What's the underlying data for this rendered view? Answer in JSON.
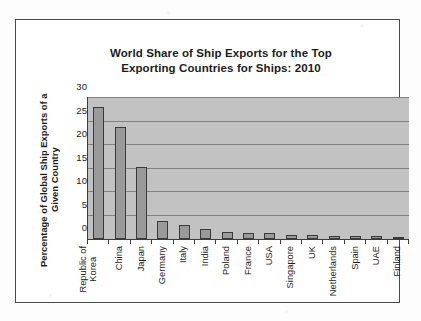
{
  "chart_data": {
    "type": "bar",
    "title": "World Share of Ship Exports for the Top Exporting Countries for Ships: 2010",
    "title_line1": "World Share of Ship Exports for the Top",
    "title_line2": "Exporting Countries for Ships: 2010",
    "xlabel": "",
    "ylabel": "Percentage of Global Ship Exports of a Given Country",
    "ylabel_line1": "Percentage of Global Ship Exports of a",
    "ylabel_line2": "Given Country",
    "ylim": [
      0,
      30
    ],
    "yticks": [
      0,
      5,
      10,
      15,
      20,
      25,
      30
    ],
    "ytick_labels": [
      "0",
      "5",
      "10",
      "15",
      "20",
      "25",
      "30"
    ],
    "grid": true,
    "grid_axis": "y",
    "legend": false,
    "legend_position": "none",
    "categories": [
      "Republic of Korea",
      "China",
      "Japan",
      "Germany",
      "Italy",
      "India",
      "Poland",
      "France",
      "USA",
      "Singapore",
      "UK",
      "Netherlands",
      "Spain",
      "UAE",
      "Finland"
    ],
    "category_label_lines": [
      [
        "Republic of",
        "Korea"
      ],
      [
        "China"
      ],
      [
        "Japan"
      ],
      [
        "Germany"
      ],
      [
        "Italy"
      ],
      [
        "India"
      ],
      [
        "Poland"
      ],
      [
        "France"
      ],
      [
        "USA"
      ],
      [
        "Singapore"
      ],
      [
        "UK"
      ],
      [
        "Netherlands"
      ],
      [
        "Spain"
      ],
      [
        "UAE"
      ],
      [
        "Finland"
      ]
    ],
    "values": [
      28.0,
      23.8,
      15.3,
      3.9,
      3.0,
      2.2,
      1.5,
      1.2,
      1.2,
      0.9,
      0.9,
      0.7,
      0.6,
      0.6,
      0.5
    ],
    "units": "percent",
    "colors": {
      "bar_fill": "#9a9a9a",
      "bar_edge": "#3a3a3a",
      "plot_background": "#c2c2c2",
      "gridline": "#828282",
      "axis": "#3d3d3d",
      "text": "#1c1c1c",
      "frame": "#4a4a4a",
      "page_background": "#fdfdfd"
    }
  }
}
